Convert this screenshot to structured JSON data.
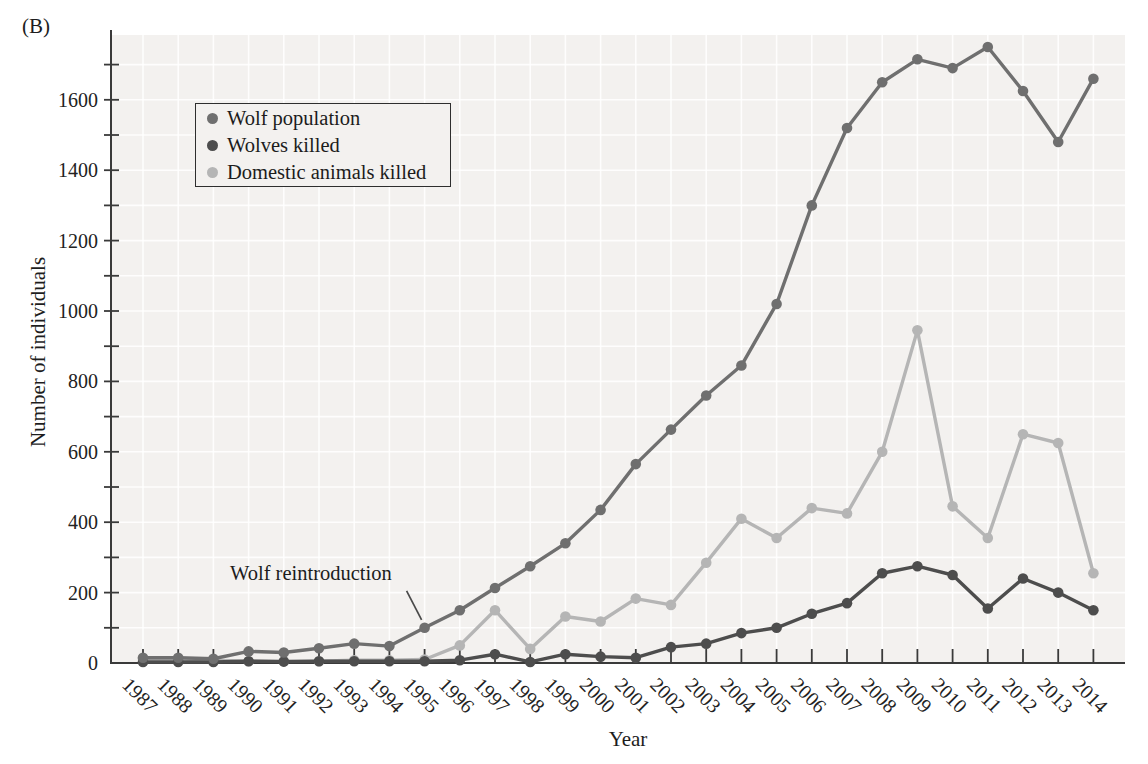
{
  "figure": {
    "panel_label": "(B)",
    "y_axis_label": "Number of individuals",
    "x_axis_label": "Year",
    "annotation_text": "Wolf reintroduction",
    "colors": {
      "wolf_population": "#6f6f6f",
      "wolves_killed": "#4d4d4d",
      "domestic_animals_killed": "#b5b5b5",
      "axis": "#3a3a3a",
      "panel_background": "#f3f1ef",
      "gridline": "#ffffff"
    }
  },
  "chart_data": {
    "type": "line",
    "title": "",
    "xlabel": "Year",
    "ylabel": "Number of individuals",
    "x": [
      1987,
      1988,
      1989,
      1990,
      1991,
      1992,
      1993,
      1994,
      1995,
      1996,
      1997,
      1998,
      1999,
      2000,
      2001,
      2002,
      2003,
      2004,
      2005,
      2006,
      2007,
      2008,
      2009,
      2010,
      2011,
      2012,
      2013,
      2014
    ],
    "ylim": [
      0,
      1780
    ],
    "y_major_ticks": [
      0,
      200,
      400,
      600,
      800,
      1000,
      1200,
      1400,
      1600
    ],
    "y_minor_step": 100,
    "grid": true,
    "legend_position": "upper-left",
    "series": [
      {
        "name": "Wolf population",
        "color": "#6f6f6f",
        "values": [
          15,
          15,
          12,
          33,
          30,
          42,
          55,
          48,
          100,
          150,
          213,
          275,
          340,
          435,
          565,
          663,
          760,
          845,
          1020,
          1300,
          1520,
          1650,
          1715,
          1690,
          1750,
          1625,
          1480,
          1660
        ]
      },
      {
        "name": "Wolves killed",
        "color": "#4d4d4d",
        "values": [
          3,
          3,
          3,
          5,
          4,
          5,
          5,
          5,
          5,
          8,
          25,
          3,
          25,
          18,
          15,
          45,
          55,
          85,
          100,
          140,
          170,
          255,
          275,
          250,
          155,
          240,
          200,
          150
        ]
      },
      {
        "name": "Domestic animals killed",
        "color": "#b5b5b5",
        "values": [
          12,
          12,
          8,
          5,
          5,
          5,
          8,
          8,
          10,
          50,
          150,
          40,
          132,
          118,
          183,
          165,
          285,
          410,
          355,
          440,
          425,
          600,
          945,
          445,
          355,
          650,
          625,
          255
        ]
      }
    ],
    "annotation": {
      "text": "Wolf reintroduction",
      "target_x": 1995,
      "target_series": "Wolf population"
    }
  }
}
